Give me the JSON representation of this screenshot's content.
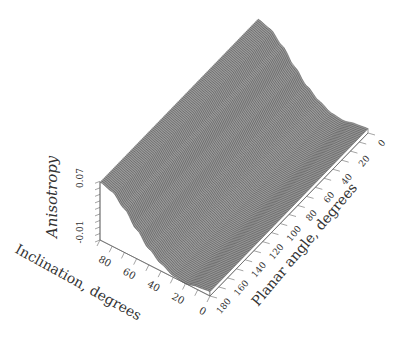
{
  "chart_data": {
    "type": "surface3d",
    "title": "",
    "zlabel": "Anisotropy",
    "xlabel": "Inclination, degrees",
    "ylabel": "Planar angle, degrees",
    "z_ticks": [
      "-0.01",
      "0.07"
    ],
    "x_ticks": [
      "80",
      "60",
      "40",
      "20",
      "0"
    ],
    "y_ticks": [
      "0",
      "20",
      "40",
      "60",
      "80",
      "100",
      "120",
      "140",
      "160",
      "180"
    ],
    "x_range": [
      0,
      90
    ],
    "y_range": [
      0,
      180
    ],
    "z_range": [
      -0.01,
      0.07
    ],
    "inclination_profile": {
      "x": [
        90,
        80,
        70,
        60,
        50,
        40,
        30,
        20,
        10,
        0
      ],
      "z": [
        0.07,
        0.065,
        0.05,
        0.03,
        0.012,
        0.0,
        -0.008,
        -0.01,
        -0.006,
        -0.004
      ]
    },
    "grid": false
  }
}
